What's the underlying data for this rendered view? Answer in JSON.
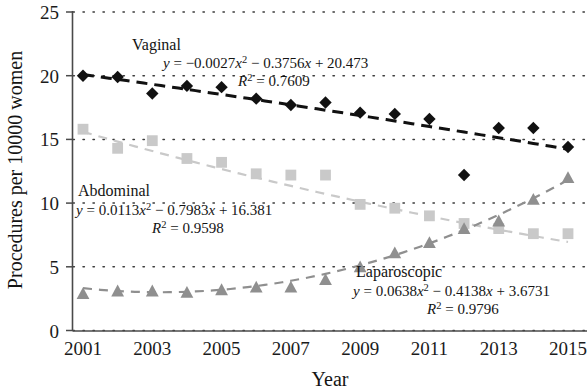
{
  "chart_data": {
    "type": "scatter",
    "title": "",
    "xlabel": "Year",
    "ylabel": "Procedures per 10000 women",
    "xlim": [
      2000.5,
      2015.5
    ],
    "ylim": [
      0,
      25
    ],
    "yticks": [
      "0",
      "5",
      "10",
      "15",
      "20",
      "25"
    ],
    "ytick_values": [
      0,
      5,
      10,
      15,
      20,
      25
    ],
    "xticks": [
      "2001",
      "2003",
      "2005",
      "2007",
      "2009",
      "2011",
      "2013",
      "2015"
    ],
    "xtick_values": [
      2001,
      2003,
      2005,
      2007,
      2009,
      2011,
      2013,
      2015
    ],
    "grid": "horizontal dotted",
    "legend": "inline annotations",
    "x": [
      2001,
      2002,
      2003,
      2004,
      2005,
      2006,
      2007,
      2008,
      2009,
      2010,
      2011,
      2012,
      2013,
      2014,
      2015
    ],
    "series": [
      {
        "name": "Vaginal",
        "marker": "diamond",
        "color": "#111111",
        "trendline": "dashed",
        "equation": "y = −0.0027x² − 0.3756x + 20.473",
        "r_squared": "R² = 0.7609",
        "equation_plain": "y = -0.0027x^2 - 0.3756x + 20.473",
        "r2_value": 0.7609,
        "coefficients": {
          "a": -0.0027,
          "b": -0.3756,
          "c": 20.473
        },
        "values": [
          20.0,
          19.9,
          18.6,
          19.2,
          19.1,
          18.2,
          17.7,
          17.9,
          17.1,
          17.0,
          16.6,
          12.2,
          15.9,
          15.9,
          14.4
        ]
      },
      {
        "name": "Abdominal",
        "marker": "square",
        "color": "#c9c9c9",
        "trendline": "dashed",
        "equation": "y = 0.0113x² − 0.7983x + 16.381",
        "r_squared": "R² = 0.9598",
        "equation_plain": "y = 0.0113x^2 - 0.7983x + 16.381",
        "r2_value": 0.9598,
        "coefficients": {
          "a": 0.0113,
          "b": -0.7983,
          "c": 16.381
        },
        "values": [
          15.8,
          14.3,
          14.9,
          13.5,
          13.2,
          12.3,
          12.2,
          12.2,
          9.9,
          9.6,
          9.0,
          8.4,
          8.0,
          7.6,
          7.6
        ]
      },
      {
        "name": "Laparoscopic",
        "marker": "triangle",
        "color": "#8f8f8f",
        "trendline": "dashed",
        "equation": "y = 0.0638x² − 0.4138x + 3.6731",
        "r_squared": "R² = 0.9796",
        "equation_plain": "y = 0.0638x^2 - 0.4138x + 3.6731",
        "r2_value": 0.9796,
        "coefficients": {
          "a": 0.0638,
          "b": -0.4138,
          "c": 3.6731
        },
        "values": [
          2.9,
          3.1,
          3.1,
          3.0,
          3.2,
          3.4,
          3.4,
          4.0,
          5.0,
          6.1,
          6.9,
          8.0,
          8.6,
          10.3,
          12.0
        ]
      }
    ],
    "annotations": [
      {
        "series": "Vaginal",
        "label": "Vaginal",
        "label_x": 132,
        "label_y": 50,
        "eq_x": 163,
        "eq_y": 68,
        "r2_x": 238,
        "r2_y": 86
      },
      {
        "series": "Abdominal",
        "label": "Abdominal",
        "label_x": 78,
        "label_y": 196,
        "eq_x": 76,
        "eq_y": 215,
        "r2_x": 152,
        "r2_y": 233
      },
      {
        "series": "Laparoscopic",
        "label": "Laparoscopic",
        "label_x": 356,
        "label_y": 277,
        "eq_x": 353,
        "eq_y": 296,
        "r2_x": 427,
        "r2_y": 314
      }
    ]
  }
}
